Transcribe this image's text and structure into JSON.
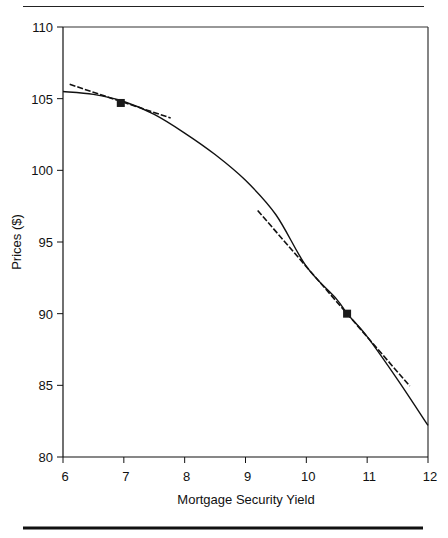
{
  "chart_data": {
    "type": "line",
    "title": "",
    "xlabel": "Mortgage Security Yield",
    "ylabel": "Prices ($)",
    "xlim": [
      6,
      12
    ],
    "ylim": [
      80,
      110
    ],
    "xticks": [
      6,
      7,
      8,
      9,
      10,
      11,
      12
    ],
    "yticks": [
      80,
      85,
      90,
      95,
      100,
      105,
      110
    ],
    "xtick_labels": [
      "6",
      "7",
      "8",
      "9",
      "10",
      "11",
      "12"
    ],
    "ytick_labels": [
      "80",
      "85",
      "90",
      "95",
      "100",
      "105",
      "110"
    ],
    "grid": false,
    "legend": "none",
    "series": [
      {
        "name": "price-yield curve",
        "style": "solid",
        "x": [
          6.0,
          6.5,
          7.0,
          7.5,
          8.0,
          8.5,
          9.0,
          9.5,
          10.0,
          10.5,
          10.67,
          11.0,
          11.5,
          12.0
        ],
        "y": [
          105.5,
          105.3,
          104.8,
          103.9,
          102.6,
          101.1,
          99.3,
          96.9,
          93.3,
          91.0,
          90.0,
          88.4,
          85.4,
          82.2
        ]
      },
      {
        "name": "tangent at low yield",
        "style": "dashed",
        "x": [
          6.11,
          7.77
        ],
        "y": [
          106.0,
          103.65
        ]
      },
      {
        "name": "tangent at high yield",
        "style": "dashed",
        "x": [
          9.2,
          11.7
        ],
        "y": [
          97.2,
          84.95
        ]
      }
    ],
    "markers": [
      {
        "name": "point-low-yield",
        "x": 6.95,
        "y": 104.7,
        "shape": "square"
      },
      {
        "name": "point-high-yield",
        "x": 10.67,
        "y": 90.0,
        "shape": "square"
      }
    ]
  }
}
